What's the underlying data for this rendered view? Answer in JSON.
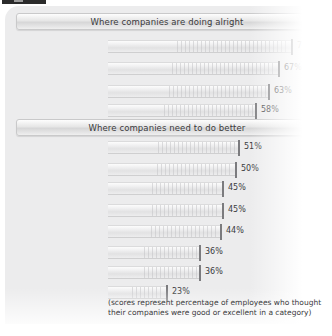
{
  "chart_data": {
    "type": "bar",
    "title": "",
    "xlabel": "",
    "ylabel": "",
    "xlim": [
      0,
      100
    ],
    "grid": false,
    "orientation": "horizontal",
    "value_suffix": "%",
    "note": "(scores represent percentage of employees who thought their companies were good or excellent in a category)",
    "groups": [
      {
        "header": "Where companies are doing alright",
        "categories": [
          "Promotes\nwithout bias",
          "Time off for personal/\nfamily issues",
          "Benefits",
          "Pay"
        ],
        "values": [
          72,
          67,
          63,
          58
        ],
        "value_labels": [
          "72%",
          "67%",
          "63%",
          "58%"
        ]
      },
      {
        "header": "Where companies need to do better",
        "categories": [
          "Flexible work\narrangements",
          "Job security",
          "Employee\ncommunication",
          "Feedback",
          "Pays for training",
          "Career advancement",
          "A place where people\nmake a difference",
          "Profit sharing"
        ],
        "values": [
          51,
          50,
          45,
          45,
          44,
          36,
          36,
          23
        ],
        "value_labels": [
          "51%",
          "50%",
          "45%",
          "45%",
          "44%",
          "36%",
          "36%",
          "23%"
        ]
      }
    ]
  },
  "sections": {
    "alright": {
      "header": "Where companies are doing alright",
      "rows": [
        {
          "label_line1": "Promotes",
          "label_line2": "without bias",
          "value": 72,
          "value_label": "72%"
        },
        {
          "label_line1": "Time off for personal/",
          "label_line2": "family issues",
          "value": 67,
          "value_label": "67%"
        },
        {
          "label_line1": "Benefits",
          "label_line2": "",
          "value": 63,
          "value_label": "63%"
        },
        {
          "label_line1": "Pay",
          "label_line2": "",
          "value": 58,
          "value_label": "58%"
        }
      ]
    },
    "better": {
      "header": "Where companies need to do better",
      "rows": [
        {
          "label_line1": "Flexible work",
          "label_line2": "arrangements",
          "value": 51,
          "value_label": "51%"
        },
        {
          "label_line1": "Job security",
          "label_line2": "",
          "value": 50,
          "value_label": "50%"
        },
        {
          "label_line1": "Employee",
          "label_line2": "communication",
          "value": 45,
          "value_label": "45%"
        },
        {
          "label_line1": "Feedback",
          "label_line2": "",
          "value": 45,
          "value_label": "45%"
        },
        {
          "label_line1": "Pays for training",
          "label_line2": "",
          "value": 44,
          "value_label": "44%"
        },
        {
          "label_line1": "Career advancement",
          "label_line2": "",
          "value": 36,
          "value_label": "36%"
        },
        {
          "label_line1": "A place where people",
          "label_line2": "make a difference",
          "value": 36,
          "value_label": "36%"
        },
        {
          "label_line1": "Profit sharing",
          "label_line2": "",
          "value": 23,
          "value_label": "23%"
        }
      ]
    }
  },
  "footnote": {
    "line1": "(scores represent percentage of employees who thought",
    "line2": "their companies were good or excellent in a category)"
  },
  "colors": {
    "panel_bg": "#ececed",
    "bar_fill": "#e8e8e9",
    "bar_cap": "#7b7b7e",
    "text": "#3b3b3d",
    "header_band": "#e0e0e1"
  },
  "layout": {
    "bar_origin_x": 108,
    "px_per_percent": 2.54
  }
}
